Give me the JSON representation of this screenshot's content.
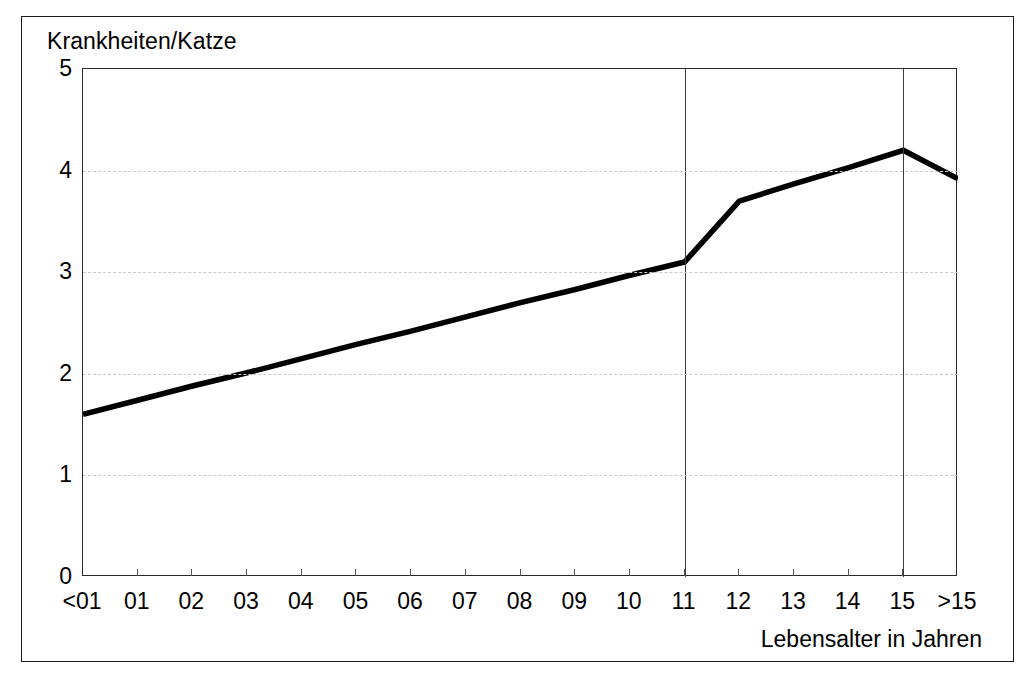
{
  "figure": {
    "y_axis_title": "Krankheiten/Katze",
    "x_axis_title": "Lebensalter in Jahren"
  },
  "chart_data": {
    "type": "line",
    "title": "",
    "ylabel": "Krankheiten/Katze",
    "xlabel": "Lebensalter in Jahren",
    "categories": [
      "<01",
      "01",
      "02",
      "03",
      "04",
      "05",
      "06",
      "07",
      "08",
      "09",
      "10",
      "11",
      "12",
      "13",
      "14",
      "15",
      ">15"
    ],
    "values": [
      1.6,
      1.74,
      1.88,
      2.01,
      2.15,
      2.29,
      2.42,
      2.56,
      2.7,
      2.83,
      2.97,
      3.1,
      3.7,
      3.87,
      4.03,
      4.2,
      3.92
    ],
    "ylim": [
      0,
      5
    ],
    "yticks": [
      0,
      1,
      2,
      3,
      4,
      5
    ],
    "ytick_labels": [
      "0",
      "1",
      "2",
      "3",
      "4",
      "5"
    ],
    "grid": "horizontal-dashed",
    "legend": "none",
    "series": [
      {
        "name": "Krankheiten/Katze",
        "color": "#000000",
        "values": [
          1.6,
          1.74,
          1.88,
          2.01,
          2.15,
          2.29,
          2.42,
          2.56,
          2.7,
          2.83,
          2.97,
          3.1,
          3.7,
          3.87,
          4.03,
          4.2,
          3.92
        ]
      }
    ],
    "annotations": [
      {
        "type": "vertical-line",
        "at_category": "11",
        "label": ""
      },
      {
        "type": "vertical-line",
        "at_category": "15",
        "label": ""
      }
    ]
  }
}
